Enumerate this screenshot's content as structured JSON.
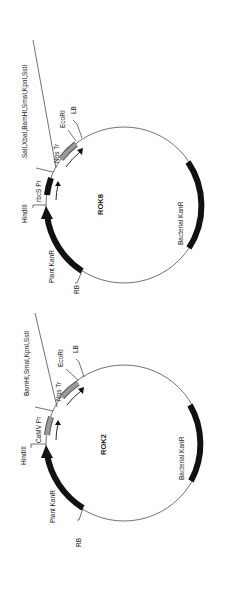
{
  "figure": {
    "colors": {
      "background": "#ffffff",
      "ink": "#111111",
      "promoter_fill": "#777777",
      "terminator_fill": "#9a9a9a"
    }
  },
  "plasmids": [
    {
      "name": "ROK8",
      "features": {
        "plant_kanr": "Plant KanR",
        "promoter": "rbcS Pr",
        "terminator": "Nos Tr",
        "bacterial_kanr": "Bacterial KanR",
        "rb": "RB",
        "lb": "LB"
      },
      "sites": {
        "hindiii": "HindIII",
        "mcs": "SalI,XbaI,BamHI,SmaI,KpnI,SstI",
        "ecori": "EcoRI"
      }
    },
    {
      "name": "ROK2",
      "features": {
        "plant_kanr": "Plant KanR",
        "promoter": "CaMV Pr",
        "terminator": "Nos Tr",
        "bacterial_kanr": "Bacterial KanR",
        "rb": "RB",
        "lb": "LB"
      },
      "sites": {
        "hindiii": "HindIII",
        "mcs": "BamHI,SmaI,KpnI,SstI",
        "ecori": "EcoRI"
      }
    }
  ]
}
